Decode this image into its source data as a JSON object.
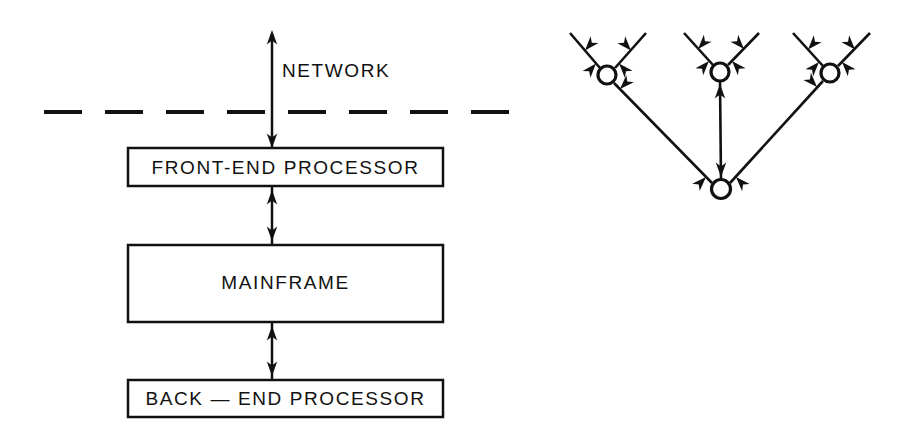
{
  "figure": {
    "background_color": "#ffffff",
    "line_color": "#111111",
    "width": 914,
    "height": 447
  },
  "left_diagram": {
    "name": "mainframe-stack",
    "network_label": "NETWORK",
    "boundary_style": "dashed",
    "boxes": [
      {
        "id": "front-end-processor",
        "label": "FRONT-END  PROCESSOR"
      },
      {
        "id": "mainframe",
        "label": "MAINFRAME"
      },
      {
        "id": "back-end-processor",
        "label": "BACK — END  PROCESSOR"
      }
    ],
    "connectors": [
      {
        "from": "network",
        "to": "front-end-processor",
        "arrow": "bidirectional"
      },
      {
        "from": "front-end-processor",
        "to": "mainframe",
        "arrow": "bidirectional"
      },
      {
        "from": "mainframe",
        "to": "back-end-processor",
        "arrow": "bidirectional"
      }
    ]
  },
  "right_diagram": {
    "name": "node-tree",
    "node_count": 4,
    "nodes": [
      {
        "id": "node-left",
        "cx": 607,
        "cy": 75
      },
      {
        "id": "node-center",
        "cx": 720,
        "cy": 72
      },
      {
        "id": "node-right",
        "cx": 830,
        "cy": 73
      },
      {
        "id": "node-root",
        "cx": 721,
        "cy": 189
      }
    ],
    "leaves": [
      {
        "id": "leaf-1",
        "x": 570,
        "y": 33
      },
      {
        "id": "leaf-2",
        "x": 646,
        "y": 33
      },
      {
        "id": "leaf-3",
        "x": 684,
        "y": 33
      },
      {
        "id": "leaf-4",
        "x": 759,
        "y": 33
      },
      {
        "id": "leaf-5",
        "x": 793,
        "y": 33
      },
      {
        "id": "leaf-6",
        "x": 870,
        "y": 33
      }
    ],
    "edges": [
      {
        "from": "leaf-1",
        "to": "node-left",
        "arrow": "bidirectional"
      },
      {
        "from": "leaf-2",
        "to": "node-left",
        "arrow": "bidirectional"
      },
      {
        "from": "leaf-3",
        "to": "node-center",
        "arrow": "bidirectional"
      },
      {
        "from": "leaf-4",
        "to": "node-center",
        "arrow": "bidirectional"
      },
      {
        "from": "leaf-5",
        "to": "node-right",
        "arrow": "bidirectional"
      },
      {
        "from": "leaf-6",
        "to": "node-right",
        "arrow": "bidirectional"
      },
      {
        "from": "node-left",
        "to": "node-root",
        "arrow": "bidirectional"
      },
      {
        "from": "node-center",
        "to": "node-root",
        "arrow": "bidirectional"
      },
      {
        "from": "node-right",
        "to": "node-root",
        "arrow": "bidirectional"
      }
    ]
  }
}
